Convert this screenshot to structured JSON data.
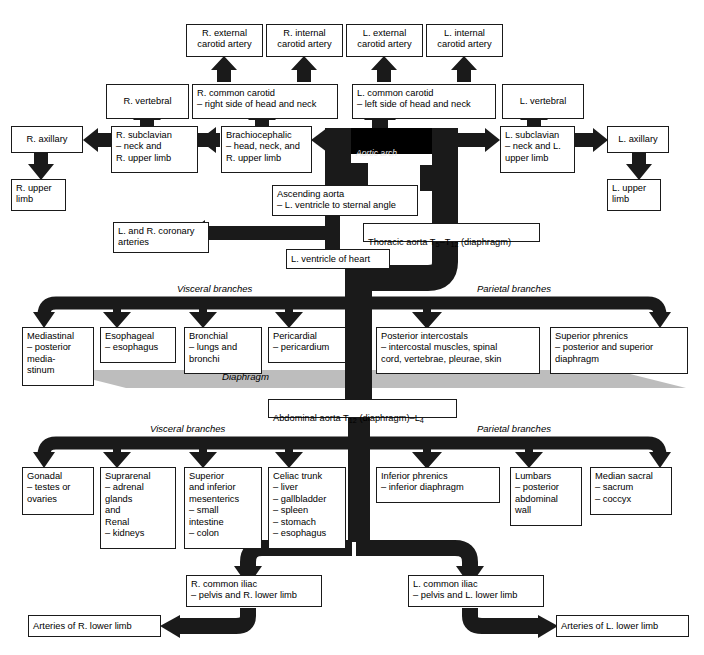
{
  "diagram": {
    "colors": {
      "vessel": "#1a1a1a",
      "box_border": "#1a1a1a",
      "diaphragm": "#b8b8b8",
      "background": "#ffffff"
    },
    "italic_labels": {
      "aortic_arch": "Aortic  arch",
      "visceral_thoracic": "Visceral  branches",
      "parietal_thoracic": "Parietal  branches",
      "diaphragm": "Diaphragm",
      "visceral_abdominal": "Visceral  branches",
      "parietal_abdominal": "Parietal  branches"
    },
    "boxes": {
      "r_external_carotid": "R. external\ncarotid artery",
      "r_internal_carotid": "R. internal\ncarotid artery",
      "l_external_carotid": "L. external\ncarotid artery",
      "l_internal_carotid": "L. internal\ncarotid artery",
      "r_vertebral": "R. vertebral",
      "r_common_carotid": "R. common carotid\n– right side of head and neck",
      "l_common_carotid": "L. common carotid\n– left side of head and neck",
      "l_vertebral": "L. vertebral",
      "r_axillary": "R. axillary",
      "r_subclavian": "R. subclavian\n– neck and\n   R. upper limb",
      "brachiocephalic": "Brachiocephalic\n– head, neck, and\n   R. upper limb",
      "l_subclavian": "L. subclavian\n– neck and L.\n   upper limb",
      "l_axillary": "L. axillary",
      "r_upper_limb": "R. upper\nlimb",
      "l_upper_limb": "L. upper\nlimb",
      "ascending_aorta": "Ascending aorta\n– L. ventricle to sternal angle",
      "coronary_arteries": "L. and R. coronary\narteries",
      "l_ventricle_heart": "L. ventricle of heart",
      "mediastinal": "Mediastinal\n– posterior\n   media-\n   stinum",
      "esophageal": "Esophageal\n– esophagus",
      "bronchial": "Bronchial\n– lungs and\n   bronchi",
      "pericardial": "Pericardial\n– pericardium",
      "posterior_intercostals": "Posterior intercostals\n– intercostal muscles, spinal\n   cord, vertebrae, pleurae, skin",
      "superior_phrenics": "Superior phrenics\n– posterior and superior\n   diaphragm",
      "gonadal": "Gonadal\n– testes or\n   ovaries",
      "suprarenal_renal": "Suprarenal\n– adrenal\n   glands\n   and\nRenal\n– kidneys",
      "mesenterics": "Superior\nand inferior\nmesenterics\n– small\n   intestine\n– colon",
      "celiac_trunk": "Celiac trunk\n– liver\n– gallbladder\n– spleen\n– stomach\n– esophagus",
      "inferior_phrenics": "Inferior phrenics\n– inferior diaphragm",
      "lumbars": "Lumbars\n– posterior\n   abdominal\n   wall",
      "median_sacral": "Median sacral\n– sacrum\n– coccyx",
      "r_common_iliac": "R. common iliac\n– pelvis and R. lower limb",
      "l_common_iliac": "L. common iliac\n– pelvis and L. lower limb",
      "arteries_r_lower_limb": "Arteries of R. lower limb",
      "arteries_l_lower_limb": "Arteries of L. lower limb"
    },
    "rich_boxes": {
      "thoracic_aorta": {
        "pre": "Thoracic aorta T",
        "sub1": "5",
        "mid": "–T",
        "sub2": "12",
        "post": " (diaphragm)"
      },
      "abdominal_aorta": {
        "pre": "Abdominal aorta T",
        "sub1": "12",
        "mid": " (diaphragm)–L",
        "sub2": "4",
        "post": ""
      }
    }
  }
}
